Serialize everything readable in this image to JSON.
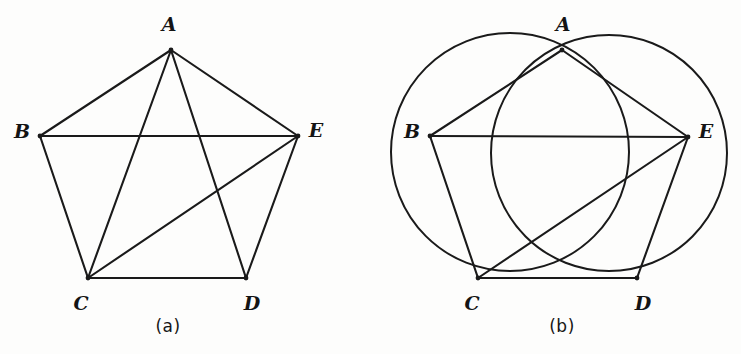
{
  "figure": {
    "width": 741,
    "height": 354,
    "background_color": "#fdfdfc",
    "ink_color": "#1a1a1a"
  },
  "panels": [
    {
      "id": "panel-a",
      "caption": "(a)",
      "caption_position": {
        "x": 168,
        "y": 326
      },
      "type": "pentagon-with-diagonals",
      "vertices": [
        {
          "name": "A",
          "x": 171,
          "y": 50,
          "label": "A",
          "label_x": 169,
          "label_y": 24
        },
        {
          "name": "B",
          "x": 40,
          "y": 136,
          "label": "B",
          "label_x": 22,
          "label_y": 131
        },
        {
          "name": "C",
          "x": 88,
          "y": 278,
          "label": "C",
          "label_x": 81,
          "label_y": 303
        },
        {
          "name": "D",
          "x": 246,
          "y": 278,
          "label": "D",
          "label_x": 252,
          "label_y": 303
        },
        {
          "name": "E",
          "x": 298,
          "y": 136,
          "label": "E",
          "label_x": 316,
          "label_y": 130
        }
      ],
      "sides": [
        {
          "from": "A",
          "to": "B"
        },
        {
          "from": "B",
          "to": "C"
        },
        {
          "from": "C",
          "to": "D"
        },
        {
          "from": "D",
          "to": "E"
        },
        {
          "from": "E",
          "to": "A"
        }
      ],
      "diagonals": [
        {
          "from": "A",
          "to": "C"
        },
        {
          "from": "A",
          "to": "D"
        },
        {
          "from": "B",
          "to": "E"
        },
        {
          "from": "C",
          "to": "E"
        }
      ],
      "circles": []
    },
    {
      "id": "panel-b",
      "caption": "(b)",
      "caption_position": {
        "x": 562,
        "y": 326
      },
      "type": "two-circles-with-chords",
      "vertices": [
        {
          "name": "A",
          "x": 562,
          "y": 50,
          "label": "A",
          "label_x": 563,
          "label_y": 24
        },
        {
          "name": "B",
          "x": 430,
          "y": 136,
          "label": "B",
          "label_x": 412,
          "label_y": 131
        },
        {
          "name": "C",
          "x": 478,
          "y": 278,
          "label": "C",
          "label_x": 472,
          "label_y": 303
        },
        {
          "name": "D",
          "x": 637,
          "y": 278,
          "label": "D",
          "label_x": 643,
          "label_y": 303
        },
        {
          "name": "E",
          "x": 688,
          "y": 137,
          "label": "E",
          "label_x": 706,
          "label_y": 131
        }
      ],
      "sides": [
        {
          "from": "A",
          "to": "B"
        },
        {
          "from": "B",
          "to": "C"
        },
        {
          "from": "C",
          "to": "D"
        },
        {
          "from": "D",
          "to": "E"
        },
        {
          "from": "E",
          "to": "A"
        }
      ],
      "diagonals": [
        {
          "from": "B",
          "to": "E"
        },
        {
          "from": "C",
          "to": "E"
        }
      ],
      "circles": [
        {
          "id": "circle-abc",
          "through": [
            "A",
            "B",
            "C"
          ],
          "cx": 510,
          "cy": 152,
          "r": 119
        },
        {
          "id": "circle-ade",
          "through": [
            "A",
            "D",
            "E"
          ],
          "cx": 609,
          "cy": 153,
          "r": 118
        }
      ]
    }
  ]
}
